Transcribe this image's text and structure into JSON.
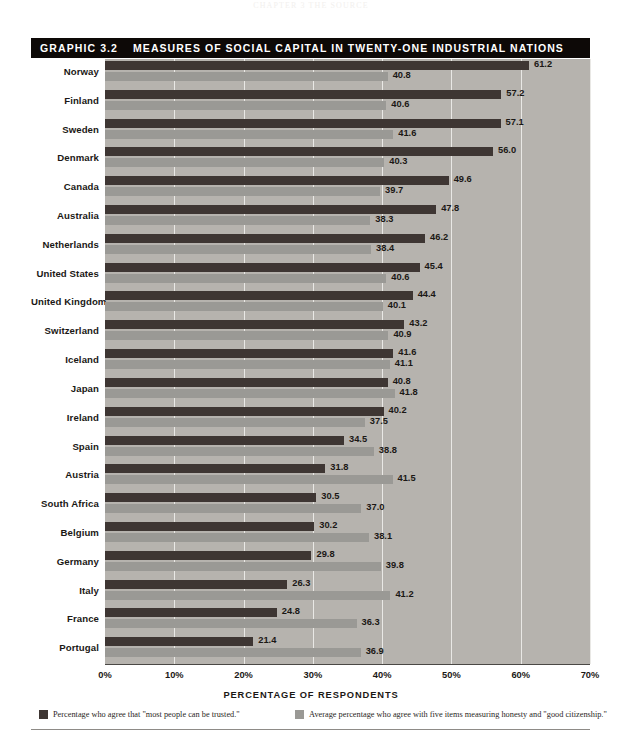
{
  "page_header": "CHAPTER 3 THE SOURCE",
  "title": {
    "graphic_number": "GRAPHIC 3.2",
    "text": "MEASURES OF SOCIAL CAPITAL IN TWENTY-ONE INDUSTRIAL NATIONS"
  },
  "axis": {
    "xlabel": "PERCENTAGE OF RESPONDENTS",
    "ticks": [
      "0%",
      "10%",
      "20%",
      "30%",
      "40%",
      "50%",
      "60%",
      "70%"
    ]
  },
  "legend": {
    "items": [
      {
        "swatch": "dark",
        "label": "Percentage who agree that \"most people can be trusted.\""
      },
      {
        "swatch": "light",
        "label": "Average percentage who agree with five items measuring honesty and \"good citizenship.\""
      }
    ]
  },
  "colors": {
    "bar_dark": "#3e3633",
    "bar_light": "#9a9995",
    "plot_background": "#b6b3ae",
    "gridline": "#e9e8e5",
    "title_bar": "#0d0907",
    "text": "#1b1815"
  },
  "chart_data": {
    "type": "bar",
    "orientation": "horizontal",
    "title": "MEASURES OF SOCIAL CAPITAL IN TWENTY-ONE INDUSTRIAL NATIONS",
    "xlabel": "PERCENTAGE OF RESPONDENTS",
    "ylabel": "",
    "xlim": [
      0,
      70
    ],
    "xticks": [
      0,
      10,
      20,
      30,
      40,
      50,
      60,
      70
    ],
    "grid": "vertical",
    "legend_position": "bottom",
    "categories": [
      "Norway",
      "Finland",
      "Sweden",
      "Denmark",
      "Canada",
      "Australia",
      "Netherlands",
      "United States",
      "United Kingdom",
      "Switzerland",
      "Iceland",
      "Japan",
      "Ireland",
      "Spain",
      "Austria",
      "South Africa",
      "Belgium",
      "Germany",
      "Italy",
      "France",
      "Portugal"
    ],
    "series": [
      {
        "name": "Percentage who agree that \"most people can be trusted.\"",
        "color": "#3e3633",
        "values": [
          61.2,
          57.2,
          57.1,
          56.0,
          49.6,
          47.8,
          46.2,
          45.4,
          44.4,
          43.2,
          41.6,
          40.8,
          40.2,
          34.5,
          31.8,
          30.5,
          30.2,
          29.8,
          26.3,
          24.8,
          21.4
        ]
      },
      {
        "name": "Average percentage who agree with five items measuring honesty and \"good citizenship.\"",
        "color": "#9a9995",
        "values": [
          40.8,
          40.6,
          41.6,
          40.3,
          39.7,
          38.3,
          38.4,
          40.6,
          40.1,
          40.9,
          41.1,
          41.8,
          37.5,
          38.8,
          41.5,
          37.0,
          38.1,
          39.8,
          41.2,
          36.3,
          36.9
        ]
      }
    ]
  }
}
